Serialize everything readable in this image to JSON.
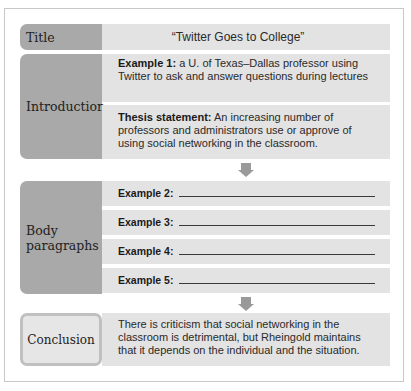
{
  "title_row": {
    "label": "Title",
    "value": "“Twitter Goes to College”"
  },
  "introduction": {
    "label": "Introduction",
    "example1": {
      "heading": "Example 1:",
      "text": " a U. of Texas–Dallas professor using Twitter to ask and answer questions during lectures"
    },
    "thesis": {
      "heading": "Thesis statement:",
      "text": " An increasing number of professors and administrators use or approve of using social networking in the classroom."
    }
  },
  "body": {
    "label": "Body paragraphs",
    "examples": [
      {
        "label": "Example 2:"
      },
      {
        "label": "Example 3:"
      },
      {
        "label": "Example 4:"
      },
      {
        "label": "Example 5:"
      }
    ]
  },
  "conclusion": {
    "label": "Conclusion",
    "text": "There is criticism that social networking in the classroom is detrimental, but Rheingold maintains that it depends on the individual and the situation."
  },
  "colors": {
    "label_bg": "#a9a9a9",
    "cell_bg": "#e3e3e3",
    "arrow": "#9a9a9a",
    "frame_border": "#c8c8c8"
  }
}
